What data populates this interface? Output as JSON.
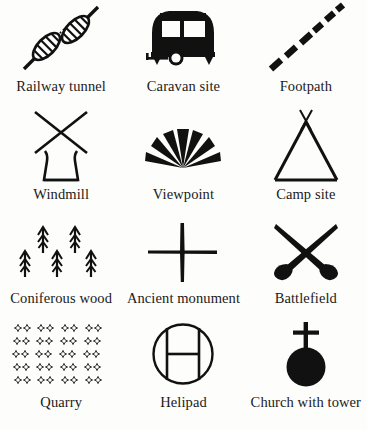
{
  "page": {
    "background_color": "#fdfdfb",
    "ink_color": "#111111",
    "columns": 3,
    "rows": 4
  },
  "symbols": [
    {
      "id": "railway-tunnel",
      "label": "Railway tunnel",
      "icon": "railway-tunnel-icon",
      "description": "Diagonal railway line with two hatched tunnel portals and dotted centre section",
      "row": 1,
      "column": 1
    },
    {
      "id": "caravan-site",
      "label": "Caravan site",
      "icon": "caravan-site-icon",
      "description": "Solid caravan body with two windows, wheel and tow bar",
      "row": 1,
      "column": 2
    },
    {
      "id": "footpath",
      "label": "Footpath",
      "icon": "footpath-icon",
      "description": "Diagonal line of six thick dashes",
      "row": 1,
      "column": 3
    },
    {
      "id": "windmill",
      "label": "Windmill",
      "icon": "windmill-icon",
      "description": "Crossed sails above a tapered tower",
      "row": 2,
      "column": 1
    },
    {
      "id": "viewpoint",
      "label": "Viewpoint",
      "icon": "viewpoint-icon",
      "description": "Fan of seven tapered rays radiating from a point",
      "row": 2,
      "column": 2
    },
    {
      "id": "camp-site",
      "label": "Camp site",
      "icon": "camp-site-icon",
      "description": "Tent triangle with crossed poles above the apex",
      "row": 2,
      "column": 3
    },
    {
      "id": "coniferous-wood",
      "label": "Coniferous wood",
      "icon": "coniferous-wood-icon",
      "description": "Five small conifer tree glyphs in two staggered rows",
      "row": 3,
      "column": 1
    },
    {
      "id": "ancient-monument",
      "label": "Ancient monument",
      "icon": "ancient-monument-icon",
      "description": "Plain upright cross with tapered strokes",
      "row": 3,
      "column": 2
    },
    {
      "id": "battlefield",
      "label": "Battlefield",
      "icon": "battlefield-icon",
      "description": "Two crossed swords with bulbous hilts at the bottom",
      "row": 3,
      "column": 3
    },
    {
      "id": "quarry",
      "label": "Quarry",
      "icon": "quarry-icon",
      "description": "Grid of small four-pointed star marks in five rows of eight",
      "row": 4,
      "column": 1,
      "grid": {
        "rows": 5,
        "marks_per_row": 8
      }
    },
    {
      "id": "helipad",
      "label": "Helipad",
      "icon": "helipad-icon",
      "description": "Outlined circle enclosing the letter H",
      "letter": "H",
      "row": 4,
      "column": 2
    },
    {
      "id": "church-with-tower",
      "label": "Church with tower",
      "icon": "church-with-tower-icon",
      "description": "Solid filled circle with a cross rising from the top",
      "row": 4,
      "column": 3
    }
  ]
}
